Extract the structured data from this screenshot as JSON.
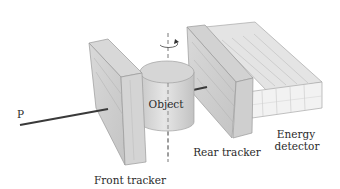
{
  "diagram": {
    "labels": {
      "beam": "P",
      "front_tracker": "Front tracker",
      "object": "Object",
      "rear_tracker": "Rear tracker",
      "energy_detector_line1": "Energy",
      "energy_detector_line2": "detector"
    },
    "components": [
      {
        "id": "beam",
        "label": "P",
        "type": "line"
      },
      {
        "id": "front-tracker",
        "label": "Front tracker",
        "type": "slab"
      },
      {
        "id": "object",
        "label": "Object",
        "type": "cylinder"
      },
      {
        "id": "rotation-axis",
        "label": "",
        "type": "dashed-axis"
      },
      {
        "id": "rear-tracker",
        "label": "Rear tracker",
        "type": "slab"
      },
      {
        "id": "energy-detector",
        "label": "Energy detector",
        "type": "segmented-box"
      }
    ],
    "colors": {
      "beam": "#3a3a3a",
      "tracker_fill": "#d4d4d4",
      "tracker_edge": "#9a9a9a",
      "cylinder_fill": "#d8d8d8",
      "detector_fill": "#e8e8e8",
      "text": "#2a2a2a"
    }
  }
}
